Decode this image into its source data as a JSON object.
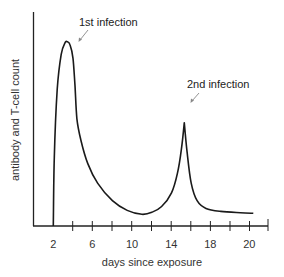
{
  "chart_data": {
    "type": "line",
    "title": "",
    "xlabel": "days since exposure",
    "ylabel": "antibody and T-cell count",
    "x_tick_labels": [
      "2",
      "6",
      "10",
      "14",
      "18",
      "20"
    ],
    "x_ticks_at": [
      2,
      4,
      6,
      8,
      10,
      12,
      14,
      16,
      18,
      20,
      22
    ],
    "xlim": [
      0,
      22.3
    ],
    "ylim": [
      0,
      100
    ],
    "grid": false,
    "legend": null,
    "series": [
      {
        "name": "immune response",
        "x": [
          2.0,
          2.1,
          2.4,
          2.8,
          3.2,
          3.4,
          3.7,
          4.0,
          4.2,
          4.4,
          4.8,
          5.5,
          6.5,
          8.0,
          9.5,
          11.0,
          12.0,
          13.0,
          14.0,
          14.6,
          15.0,
          15.3,
          15.6,
          16.0,
          16.6,
          17.5,
          19.0,
          21.0,
          22.3
        ],
        "y": [
          0,
          35,
          70,
          88,
          94,
          94.5,
          93,
          86,
          72,
          55,
          44,
          32,
          22,
          13,
          8,
          6,
          7,
          10,
          17,
          27,
          39,
          53,
          37,
          22,
          13,
          9,
          7.5,
          6.8,
          6.5
        ]
      }
    ],
    "annotations": [
      {
        "text": "1st infection",
        "points_to_x": 3.6,
        "points_to_y": 92
      },
      {
        "text": "2nd infection",
        "points_to_x": 15.4,
        "points_to_y": 55
      }
    ]
  },
  "labels": {
    "xlabel": "days since exposure",
    "ylabel": "antibody and T-cell count",
    "first_infection": "1st infection",
    "second_infection": "2nd infection",
    "ticks": [
      "2",
      "6",
      "10",
      "14",
      "18",
      "20"
    ]
  }
}
